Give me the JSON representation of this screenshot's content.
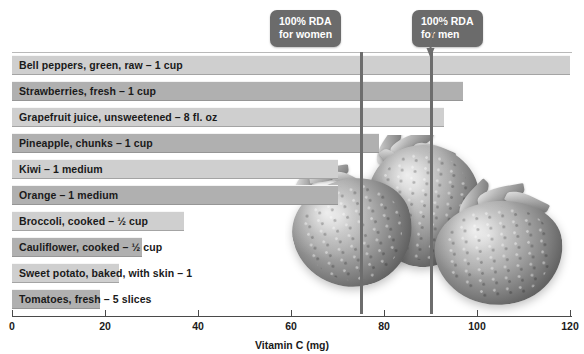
{
  "chart_data": {
    "type": "bar",
    "orientation": "horizontal",
    "title": "",
    "xlabel": "Vitamin C (mg)",
    "ylabel": "",
    "xlim": [
      0,
      120
    ],
    "xticks": [
      0,
      20,
      40,
      60,
      80,
      100,
      120
    ],
    "grid": false,
    "legend": "none",
    "categories": [
      "Bell peppers, green, raw – 1 cup",
      "Strawberries, fresh – 1 cup",
      "Grapefruit juice, unsweetened – 8 fl. oz",
      "Pineapple, chunks – 1 cup",
      "Kiwi – 1 medium",
      "Orange – 1 medium",
      "Broccoli, cooked – ½ cup",
      "Cauliflower, cooked – ½ cup",
      "Sweet potato, baked, with skin – 1",
      "Tomatoes, fresh – 5 slices"
    ],
    "values": [
      120,
      97,
      93,
      79,
      70,
      70,
      37,
      28,
      23,
      19
    ],
    "annotations": [
      {
        "label_line1": "100% RDA",
        "label_line2": "for women",
        "value": 75
      },
      {
        "label_line1": "100% RDA",
        "label_line2": "for men",
        "value": 90
      }
    ]
  },
  "axis": {
    "title": "Vitamin C (mg)",
    "tick_labels": [
      "0",
      "20",
      "40",
      "60",
      "80",
      "100",
      "120"
    ]
  },
  "bars": [
    {
      "label": "Bell peppers, green, raw – 1 cup",
      "value": 120
    },
    {
      "label": "Strawberries, fresh – 1 cup",
      "value": 97
    },
    {
      "label": "Grapefruit juice, unsweetened – 8 fl. oz",
      "value": 93
    },
    {
      "label": "Pineapple, chunks – 1 cup",
      "value": 79
    },
    {
      "label": "Kiwi – 1 medium",
      "value": 70
    },
    {
      "label": "Orange – 1 medium",
      "value": 70
    },
    {
      "label": "Broccoli, cooked – ½ cup",
      "value": 37
    },
    {
      "label": "Cauliflower, cooked – ½ cup",
      "value": 28
    },
    {
      "label": "Sweet potato, baked, with skin – 1",
      "value": 23
    },
    {
      "label": "Tomatoes, fresh – 5 slices",
      "value": 19
    }
  ],
  "callouts": {
    "women": {
      "line1": "100% RDA",
      "line2": "for women",
      "value": 75
    },
    "men": {
      "line1": "100% RDA",
      "line2": "for men",
      "value": 90
    }
  },
  "colors": {
    "bar_light": "#cfcfcf",
    "bar_dark": "#b0b0b0",
    "callout_bg": "#6b6b6b",
    "callout_text": "#ffffff",
    "rda_line": "#6d6d6d",
    "axis": "#4a4a4a",
    "text": "#1a1a1a",
    "background": "#ffffff"
  },
  "photo": {
    "name": "strawberries-photo",
    "alt": "Photograph of three fresh strawberries"
  }
}
